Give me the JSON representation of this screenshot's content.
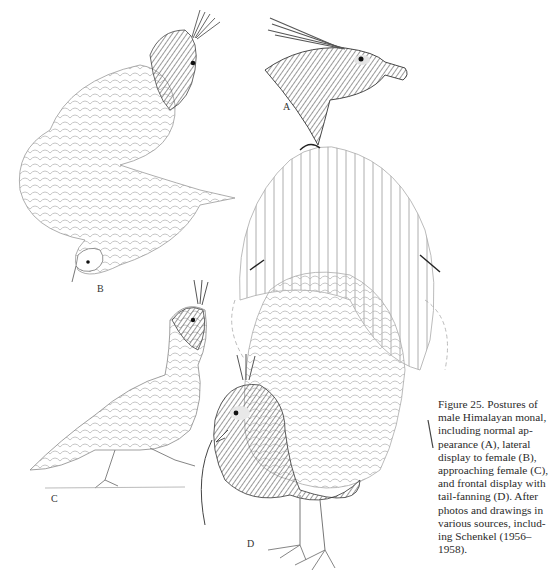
{
  "figure": {
    "panels": [
      {
        "id": "A",
        "label": "A",
        "description": "Head of male Himalayan monal, normal appearance"
      },
      {
        "id": "B",
        "label": "B",
        "description": "Lateral display to female"
      },
      {
        "id": "C",
        "label": "C",
        "description": "Approaching female"
      },
      {
        "id": "D",
        "label": "D",
        "description": "Frontal display with tail-fanning"
      }
    ],
    "caption": "Figure 25. Postures of male Himalayan monal, including normal appearance (A), lateral display to female (B), approaching female (C), and frontal display with tail-fanning (D). After photos and drawings in various sources, including Schenkel (1956–1958).",
    "caption_lines": [
      "Figure 25. Postures of",
      "male Himalayan monal,",
      "including normal ap-",
      "pearance (A), lateral",
      "display to female (B),",
      "approaching female (C),",
      "and frontal display with",
      "tail-fanning (D). After",
      "photos and drawings in",
      "various sources, includ-",
      "ing Schenkel (1956–",
      "1958)."
    ]
  }
}
